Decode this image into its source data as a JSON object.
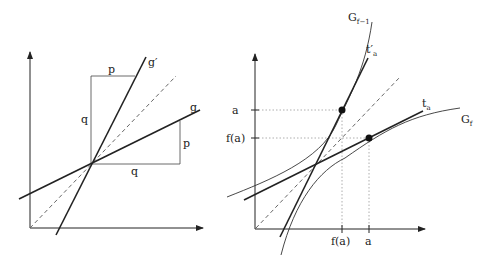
{
  "left_panel": {
    "line_g_label": "g",
    "line_g_prime_label": "g′",
    "box_top_label": "p",
    "box_left_label": "q",
    "box_right_label": "p",
    "box_bottom_label": "q"
  },
  "right_panel": {
    "curve_inverse_label": "G",
    "curve_inverse_sub": "f−1",
    "curve_f_label": "G",
    "curve_f_sub": "f",
    "tangent_a_label": "t",
    "tangent_a_sub": "a",
    "tangent_a_prime_label": "t′",
    "tangent_a_prime_sub": "a",
    "y_tick_a": "a",
    "y_tick_fa": "f(a)",
    "x_tick_fa": "f(a)",
    "x_tick_a": "a"
  },
  "colors": {
    "stroke": "#222222",
    "grid_dotted": "#999999",
    "dashed": "#666666"
  }
}
